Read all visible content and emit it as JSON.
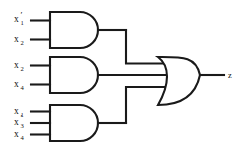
{
  "diagram": {
    "type": "logic-circuit",
    "background_color": "#ffffff",
    "line_color": "#1a1a1a"
  },
  "gates": [
    {
      "id": "and1",
      "type": "AND",
      "label": "AND",
      "input_count": 2,
      "inputs": [
        {
          "base": "x",
          "subscript": "1",
          "prime": "′",
          "name": "x1-complement"
        },
        {
          "base": "x",
          "subscript": "2",
          "prime": "",
          "name": "x2"
        }
      ],
      "output_term": "x1' x2"
    },
    {
      "id": "and2",
      "type": "AND",
      "label": "AND",
      "input_count": 2,
      "inputs": [
        {
          "base": "x",
          "subscript": "2",
          "prime": "",
          "name": "x2"
        },
        {
          "base": "x",
          "subscript": "4",
          "prime": "",
          "name": "x4"
        }
      ],
      "output_term": "x2 x4"
    },
    {
      "id": "and3",
      "type": "AND",
      "label": "AND",
      "input_count": 3,
      "inputs": [
        {
          "base": "x",
          "subscript": "1",
          "prime": "",
          "name": "x1"
        },
        {
          "base": "x",
          "subscript": "3",
          "prime": "′",
          "name": "x3-complement"
        },
        {
          "base": "x",
          "subscript": "4",
          "prime": "",
          "name": "x4"
        }
      ],
      "output_term": "x1 x3' x4"
    },
    {
      "id": "or1",
      "type": "OR",
      "label": "OR",
      "input_count": 3,
      "inputs": [],
      "output_term": "z"
    }
  ],
  "output": {
    "base": "z",
    "subscript": "",
    "prime": "",
    "name": "z",
    "expression": "z = x1' x2 + x2 x4 + x1 x3' x4"
  }
}
